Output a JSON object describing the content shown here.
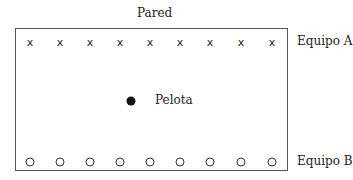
{
  "labels": {
    "wall": "Pared",
    "team_a": "Equipo A",
    "team_b": "Equipo B",
    "ball": "Pelota"
  },
  "team_a": {
    "marker": "x",
    "count": 9,
    "positions_x": [
      30,
      60,
      90,
      120,
      150,
      180,
      210,
      241,
      272
    ],
    "row_y": 42
  },
  "team_b": {
    "marker": "circle",
    "count": 9,
    "positions_x": [
      30,
      60,
      90,
      120,
      150,
      180,
      210,
      241,
      272
    ],
    "row_y": 162
  },
  "ball": {
    "x": 131,
    "y": 101
  }
}
